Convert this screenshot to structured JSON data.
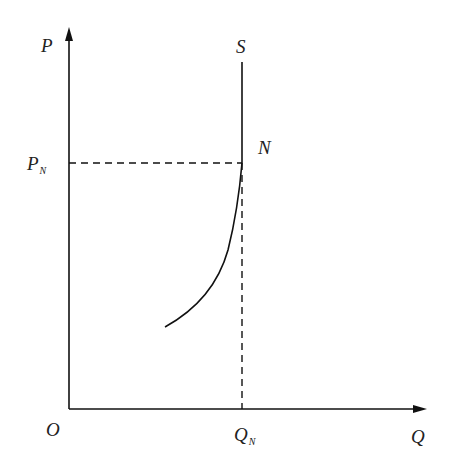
{
  "diagram": {
    "type": "economics-supply-diagram",
    "labels": {
      "y_axis": "P",
      "x_axis": "Q",
      "origin": "O",
      "price_level": "P",
      "price_level_sub": "N",
      "quantity_level": "Q",
      "quantity_level_sub": "N",
      "curve": "S",
      "point": "N"
    },
    "colors": {
      "line": "#111111",
      "text": "#222222",
      "background": "#ffffff"
    }
  }
}
